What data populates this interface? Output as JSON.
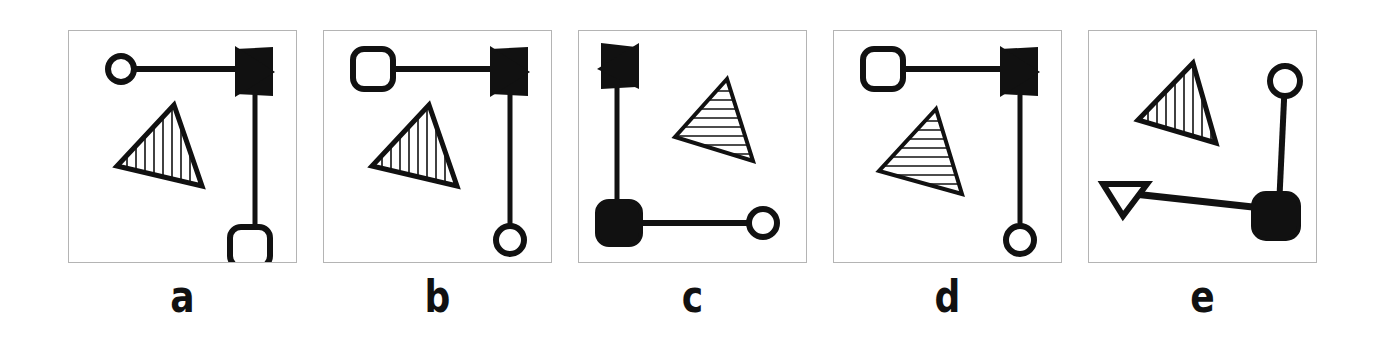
{
  "figure": {
    "background_color": "#ffffff",
    "stroke_color": "#111111",
    "box_border_color": "#b4b4b4",
    "panel_count": 5
  },
  "panels": [
    {
      "id": "panel-a",
      "label": "a",
      "description": "open circle connected by horizontal line to solid right-pointing arrowhead, vertical line down to open rounded square; vertically hatched triangle at left",
      "shapes": {
        "node_start": "open-circle",
        "node_end": "open-rounded-square",
        "arrowhead": "solid-right-arrowhead",
        "triangle_hatch": "vertical"
      }
    },
    {
      "id": "panel-b",
      "label": "b",
      "description": "open rounded square connected by horizontal line to solid right-pointing arrowhead, vertical line down to open circle; vertically hatched triangle at left",
      "shapes": {
        "node_start": "open-rounded-square",
        "node_end": "open-circle",
        "arrowhead": "solid-right-arrowhead",
        "triangle_hatch": "vertical"
      }
    },
    {
      "id": "panel-c",
      "label": "c",
      "description": "solid left-pointing arrowhead at top of vertical line down to filled rounded square, horizontal line right to open circle; horizontally hatched triangle at upper right",
      "shapes": {
        "node_start": "filled-rounded-square",
        "node_end": "open-circle",
        "arrowhead": "solid-left-arrowhead",
        "triangle_hatch": "horizontal"
      }
    },
    {
      "id": "panel-d",
      "label": "d",
      "description": "open rounded square connected by horizontal line to solid right-pointing arrowhead, vertical line down to open circle; horizontally hatched triangle at left",
      "shapes": {
        "node_start": "open-rounded-square",
        "node_end": "open-circle",
        "arrowhead": "solid-right-arrowhead",
        "triangle_hatch": "horizontal"
      }
    },
    {
      "id": "panel-e",
      "label": "e",
      "description": "open circle at upper right connected by vertical line to filled rounded square, horizontal line left to open downward-pointing triangle arrowhead; vertically hatched triangle at upper left",
      "shapes": {
        "node_start": "open-circle",
        "node_end": "filled-rounded-square",
        "arrowhead": "open-down-arrowhead",
        "triangle_hatch": "vertical"
      }
    }
  ]
}
